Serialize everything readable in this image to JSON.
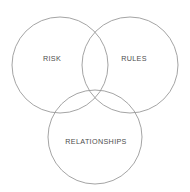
{
  "diagram": {
    "type": "venn",
    "title": "",
    "canvas": {
      "width": 190,
      "height": 192,
      "background": "#ffffff"
    },
    "style": {
      "stroke_color": "#9a9a9a",
      "stroke_width": 0.9,
      "fill": "none",
      "label_color": "#4d4d4d",
      "label_font_size": 7.2
    },
    "sets": [
      {
        "id": "risk",
        "label": "RISK",
        "cx": 60,
        "cy": 65,
        "r": 48,
        "label_x": 52,
        "label_y": 59
      },
      {
        "id": "rules",
        "label": "RULES",
        "cx": 130,
        "cy": 65,
        "r": 48,
        "label_x": 134,
        "label_y": 59
      },
      {
        "id": "relationships",
        "label": "RELATIONSHIPS",
        "cx": 95,
        "cy": 137,
        "r": 47,
        "label_x": 96,
        "label_y": 142
      }
    ]
  }
}
